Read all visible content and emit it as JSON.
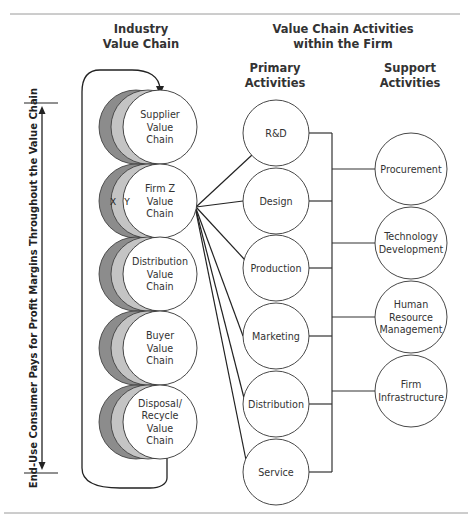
{
  "headers": {
    "industry": [
      "Industry",
      "Value Chain"
    ],
    "firm_activities": [
      "Value Chain Activities",
      "within the Firm"
    ],
    "primary": [
      "Primary",
      "Activities"
    ],
    "support": [
      "Support",
      "Activities"
    ]
  },
  "side_label": "End-Use Consumer Pays for Profit Margins Throughout the Value Chain",
  "industry_chain": [
    {
      "lines": [
        "Supplier",
        "Value",
        "Chain"
      ]
    },
    {
      "lines": [
        "Firm Z",
        "Value",
        "Chain"
      ],
      "crescent_labels": [
        "X",
        "Y"
      ]
    },
    {
      "lines": [
        "Distribution",
        "Value",
        "Chain"
      ]
    },
    {
      "lines": [
        "Buyer",
        "Value",
        "Chain"
      ]
    },
    {
      "lines": [
        "Disposal/",
        "Recycle",
        "Value",
        "Chain"
      ]
    }
  ],
  "primary_activities": [
    "R&D",
    "Design",
    "Production",
    "Marketing",
    "Distribution",
    "Service"
  ],
  "support_activities": [
    {
      "lines": [
        "Procurement"
      ]
    },
    {
      "lines": [
        "Technology",
        "Development"
      ]
    },
    {
      "lines": [
        "Human",
        "Resource",
        "Management"
      ]
    },
    {
      "lines": [
        "Firm",
        "Infrastructure"
      ]
    }
  ],
  "colors": {
    "crescent_dark": "#8c8c8c",
    "crescent_light": "#c4c4c4",
    "circle_fill": "#ffffff",
    "stroke": "#333333",
    "rule": "#9a9a9a"
  }
}
